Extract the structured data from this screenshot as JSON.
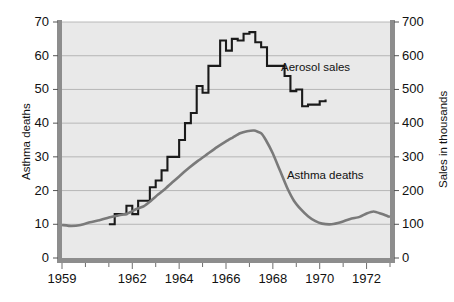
{
  "chart_data": {
    "type": "line",
    "title": "",
    "xlabel": "",
    "x_ticks": [
      "1959",
      "1962",
      "1964",
      "1966",
      "1968",
      "1970",
      "1972"
    ],
    "x_tick_values": [
      1959,
      1962,
      1964,
      1966,
      1968,
      1970,
      1972
    ],
    "xlim": [
      1959,
      1973
    ],
    "grid": true,
    "grid_axis": "y",
    "legend_position": "inline-annotations",
    "axes": {
      "left": {
        "label": "Asthma deaths",
        "ticks": [
          0,
          10,
          20,
          30,
          40,
          50,
          60,
          70
        ],
        "ylim": [
          0,
          70
        ],
        "color": "#7a7a7a"
      },
      "right": {
        "label": "Sales in thousands",
        "ticks": [
          0,
          100,
          200,
          300,
          400,
          500,
          600,
          700
        ],
        "ylim": [
          0,
          700
        ],
        "color": "#1a1a1a"
      }
    },
    "series": [
      {
        "name": "Aerosol sales",
        "axis": "right",
        "style": "step",
        "color": "#1a1a1a",
        "annotation": "Aerosol sales",
        "annotation_x": 1968.35,
        "annotation_y": 560,
        "x": [
          1961.0,
          1961.25,
          1961.5,
          1961.75,
          1962.0,
          1962.25,
          1962.5,
          1962.75,
          1963.0,
          1963.25,
          1963.5,
          1963.75,
          1964.0,
          1964.25,
          1964.5,
          1964.75,
          1965.0,
          1965.25,
          1965.5,
          1965.75,
          1966.0,
          1966.25,
          1966.5,
          1966.75,
          1967.0,
          1967.25,
          1967.5,
          1967.75,
          1968.0,
          1968.25,
          1968.5,
          1968.75,
          1969.0,
          1969.25,
          1969.5,
          1969.75,
          1970.0,
          1970.25
        ],
        "values": [
          100,
          130,
          130,
          155,
          130,
          170,
          170,
          210,
          230,
          260,
          300,
          300,
          350,
          400,
          430,
          510,
          490,
          570,
          570,
          645,
          615,
          650,
          645,
          665,
          670,
          640,
          625,
          570,
          570,
          570,
          540,
          495,
          500,
          450,
          455,
          455,
          465,
          470
        ]
      },
      {
        "name": "Asthma deaths",
        "axis": "left",
        "style": "smooth",
        "color": "#7a7a7a",
        "annotation": "Asthma deaths",
        "annotation_x": 1968.6,
        "annotation_y": 24,
        "x": [
          1959.0,
          1959.4,
          1959.8,
          1960.2,
          1960.6,
          1961.0,
          1961.4,
          1961.8,
          1962.2,
          1962.5,
          1962.8,
          1963.1,
          1963.4,
          1963.7,
          1964.0,
          1964.4,
          1964.8,
          1965.2,
          1965.6,
          1966.0,
          1966.3,
          1966.6,
          1966.9,
          1967.2,
          1967.5,
          1967.7,
          1968.0,
          1968.3,
          1968.6,
          1968.9,
          1969.2,
          1969.5,
          1969.8,
          1970.1,
          1970.5,
          1970.9,
          1971.3,
          1971.7,
          1972.0,
          1972.3,
          1972.6,
          1972.9,
          1973.0
        ],
        "values": [
          9.8,
          9.5,
          9.8,
          10.6,
          11.2,
          12.0,
          12.6,
          13.2,
          14.6,
          15.4,
          17.0,
          18.8,
          20.5,
          22.4,
          24.2,
          26.6,
          28.8,
          30.8,
          32.8,
          34.6,
          35.8,
          37.0,
          37.6,
          37.8,
          37.0,
          35.0,
          31.0,
          26.0,
          21.0,
          17.0,
          14.4,
          12.4,
          11.0,
          10.2,
          10.0,
          10.6,
          11.6,
          12.2,
          13.2,
          13.8,
          13.2,
          12.4,
          12.2
        ]
      }
    ]
  }
}
